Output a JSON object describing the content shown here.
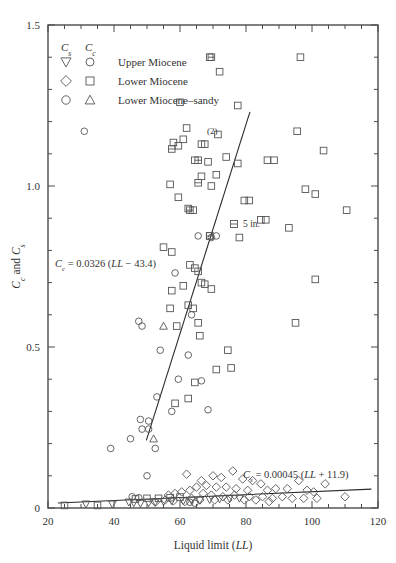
{
  "figure": {
    "title": "",
    "background_color": "#ffffff",
    "marker_color": "#555555",
    "line_color": "#2a2a2a",
    "frame_color": "#4a4a4a"
  },
  "axes": {
    "x": {
      "label_prefix": "Liquid limit (",
      "label_symbol": "LL",
      "label_suffix": ")",
      "label_full": "Liquid limit (LL)",
      "min": 20,
      "max": 120,
      "ticks": [
        20,
        40,
        60,
        80,
        100,
        120
      ],
      "tick_labels": [
        "20",
        "40",
        "60",
        "80",
        "100",
        "120"
      ],
      "minor_tick_step": 5
    },
    "y": {
      "label_full": "Cc and Cs",
      "label_sym1": "C",
      "label_sub1": "c",
      "label_mid": " and ",
      "label_sym2": "C",
      "label_sub2": "s",
      "min": 0,
      "max": 1.5,
      "ticks": [
        0,
        0.5,
        1.0,
        1.5
      ],
      "tick_labels": [
        "0",
        "0.5",
        "1.0",
        "1.5"
      ],
      "minor_tick_step": 0.1
    }
  },
  "legend": {
    "header_cs": "C",
    "header_cs_sub": "s",
    "header_cc": "C",
    "header_cc_sub": "c",
    "rows": [
      {
        "cs_marker": "triangle-down",
        "cc_marker": "circle",
        "label": "Upper Miocene"
      },
      {
        "cs_marker": "diamond",
        "cc_marker": "square",
        "label": "Lower Miocene"
      },
      {
        "cs_marker": "circle",
        "cc_marker": "triangle-up",
        "label": "Lower Miocene–sandy"
      }
    ]
  },
  "annotations": [
    {
      "name": "cc-equation",
      "text": "Cc = 0.0326 (LL − 43.4)",
      "sym": "C",
      "sub": "c",
      "eq": " = 0.0326 (",
      "ital": "LL",
      "tail": " − 43.4)",
      "x": 55,
      "y": 267
    },
    {
      "name": "cs-equation",
      "text": "Cs = 0.00045 (LL + 11.9)",
      "sym": "C",
      "sub": "s",
      "eq": " = 0.00045 (",
      "ital": "LL",
      "tail": " + 11.9)",
      "x": 243,
      "y": 478
    },
    {
      "name": "count-note",
      "text": "(2)",
      "x": 207,
      "y": 134
    },
    {
      "name": "size-note",
      "text": "5 in.",
      "x": 243,
      "y": 227
    }
  ],
  "chart_data": {
    "type": "scatter",
    "title": "",
    "xlabel": "Liquid limit (LL)",
    "ylabel": "Cc and Cs",
    "xlim": [
      20,
      120
    ],
    "ylim": [
      0,
      1.5
    ],
    "grid": false,
    "legend_position": "upper-left-inside",
    "series": [
      {
        "name": "Cc Upper Miocene",
        "marker": "circle",
        "symbol": "Cc",
        "points": [
          [
            31.0,
            1.17
          ],
          [
            58.5,
            0.73
          ],
          [
            63.5,
            0.6
          ],
          [
            47.5,
            0.58
          ],
          [
            48.5,
            0.565
          ],
          [
            54.0,
            0.49
          ],
          [
            62.5,
            0.475
          ],
          [
            59.5,
            0.4
          ],
          [
            66.5,
            0.395
          ],
          [
            53.0,
            0.345
          ],
          [
            68.5,
            0.305
          ],
          [
            57.5,
            0.3
          ],
          [
            48.0,
            0.275
          ],
          [
            50.5,
            0.27
          ],
          [
            48.5,
            0.245
          ],
          [
            50.5,
            0.245
          ],
          [
            45.0,
            0.215
          ],
          [
            39.0,
            0.185
          ],
          [
            52.5,
            0.185
          ],
          [
            50.0,
            0.1
          ],
          [
            69.5,
            0.84
          ],
          [
            71.0,
            0.845
          ],
          [
            65.5,
            0.845
          ]
        ]
      },
      {
        "name": "Cc Lower Miocene",
        "marker": "square",
        "symbol": "Cc",
        "points": [
          [
            69.0,
            1.4
          ],
          [
            96.5,
            1.4
          ],
          [
            72.0,
            1.355
          ],
          [
            60.0,
            1.26
          ],
          [
            77.5,
            1.25
          ],
          [
            62.0,
            1.18
          ],
          [
            95.5,
            1.17
          ],
          [
            71.5,
            1.16
          ],
          [
            103.5,
            1.11
          ],
          [
            58.0,
            1.135
          ],
          [
            59.5,
            1.125
          ],
          [
            61.0,
            1.145
          ],
          [
            66.5,
            1.13
          ],
          [
            67.5,
            1.13
          ],
          [
            64.5,
            1.08
          ],
          [
            68.5,
            1.075
          ],
          [
            74.0,
            1.09
          ],
          [
            86.5,
            1.08
          ],
          [
            88.5,
            1.08
          ],
          [
            66.5,
            1.03
          ],
          [
            69.5,
            1.0
          ],
          [
            98.0,
            0.99
          ],
          [
            101.0,
            0.975
          ],
          [
            57.0,
            1.005
          ],
          [
            59.5,
            0.965
          ],
          [
            62.5,
            0.93
          ],
          [
            64.0,
            0.925
          ],
          [
            110.5,
            0.925
          ],
          [
            93.0,
            0.87
          ],
          [
            69.0,
            0.845
          ],
          [
            78.0,
            0.84
          ],
          [
            55.0,
            0.81
          ],
          [
            57.5,
            0.795
          ],
          [
            101.0,
            0.71
          ],
          [
            63.0,
            0.755
          ],
          [
            64.5,
            0.745
          ],
          [
            65.5,
            0.735
          ],
          [
            66.5,
            0.7
          ],
          [
            67.5,
            0.695
          ],
          [
            69.5,
            0.68
          ],
          [
            61.0,
            0.69
          ],
          [
            57.5,
            0.675
          ],
          [
            62.5,
            0.63
          ],
          [
            64.0,
            0.62
          ],
          [
            57.0,
            0.62
          ],
          [
            65.5,
            0.575
          ],
          [
            95.0,
            0.575
          ],
          [
            59.0,
            0.565
          ],
          [
            66.0,
            0.535
          ],
          [
            74.5,
            0.49
          ],
          [
            75.5,
            0.435
          ],
          [
            71.0,
            0.43
          ],
          [
            64.5,
            0.39
          ],
          [
            62.5,
            0.34
          ],
          [
            58.5,
            0.325
          ],
          [
            84.5,
            0.895
          ],
          [
            86.0,
            0.895
          ],
          [
            79.5,
            0.955
          ],
          [
            81.0,
            0.955
          ],
          [
            77.5,
            1.07
          ],
          [
            71.0,
            1.035
          ]
        ]
      },
      {
        "name": "Cc Lower Miocene-sandy",
        "marker": "triangle-up",
        "symbol": "Cc",
        "points": [
          [
            55.0,
            0.565
          ],
          [
            52.0,
            0.215
          ]
        ]
      },
      {
        "name": "Cc five-inch sample",
        "marker": "square-hbar",
        "symbol": "Cc",
        "points": [
          [
            69.5,
            1.4
          ],
          [
            57.5,
            1.115
          ],
          [
            65.5,
            1.08
          ],
          [
            65.5,
            1.01
          ],
          [
            63.0,
            0.925
          ],
          [
            69.0,
            0.845
          ]
        ]
      },
      {
        "name": "Cs Upper Miocene",
        "marker": "triangle-down",
        "symbol": "Cs",
        "points": [
          [
            31.5,
            0.012
          ],
          [
            39.5,
            0.012
          ],
          [
            44.5,
            0.018
          ],
          [
            46.0,
            0.016
          ],
          [
            48.0,
            0.014
          ],
          [
            50.5,
            0.016
          ],
          [
            52.5,
            0.018
          ],
          [
            55.0,
            0.02
          ],
          [
            57.5,
            0.022
          ],
          [
            61.0,
            0.022
          ],
          [
            63.5,
            0.024
          ],
          [
            66.0,
            0.024
          ],
          [
            69.0,
            0.026
          ],
          [
            72.0,
            0.028
          ],
          [
            75.0,
            0.03
          ],
          [
            78.0,
            0.03
          ]
        ]
      },
      {
        "name": "Cs Lower Miocene",
        "marker": "diamond",
        "symbol": "Cs",
        "points": [
          [
            62.0,
            0.105
          ],
          [
            66.5,
            0.085
          ],
          [
            70.0,
            0.1
          ],
          [
            72.5,
            0.095
          ],
          [
            76.0,
            0.115
          ],
          [
            79.0,
            0.09
          ],
          [
            82.0,
            0.085
          ],
          [
            84.5,
            0.075
          ],
          [
            96.0,
            0.085
          ],
          [
            104.0,
            0.075
          ],
          [
            110.0,
            0.035
          ],
          [
            100.5,
            0.05
          ],
          [
            98.5,
            0.055
          ],
          [
            92.5,
            0.06
          ],
          [
            89.0,
            0.06
          ],
          [
            86.5,
            0.055
          ],
          [
            80.5,
            0.055
          ],
          [
            77.0,
            0.06
          ],
          [
            74.0,
            0.065
          ],
          [
            71.0,
            0.065
          ],
          [
            68.0,
            0.07
          ],
          [
            65.0,
            0.065
          ],
          [
            63.0,
            0.055
          ],
          [
            60.5,
            0.05
          ],
          [
            58.5,
            0.045
          ],
          [
            56.5,
            0.04
          ],
          [
            67.0,
            0.045
          ],
          [
            69.5,
            0.04
          ],
          [
            73.0,
            0.035
          ],
          [
            76.5,
            0.04
          ],
          [
            81.0,
            0.035
          ],
          [
            85.0,
            0.035
          ],
          [
            88.0,
            0.03
          ],
          [
            91.0,
            0.035
          ],
          [
            94.0,
            0.03
          ],
          [
            97.5,
            0.03
          ],
          [
            101.5,
            0.03
          ],
          [
            63.5,
            0.03
          ],
          [
            66.0,
            0.025
          ],
          [
            70.5,
            0.025
          ],
          [
            74.5,
            0.025
          ],
          [
            79.5,
            0.025
          ],
          [
            83.0,
            0.025
          ],
          [
            87.0,
            0.02
          ],
          [
            61.5,
            0.02
          ],
          [
            58.0,
            0.022
          ],
          [
            55.5,
            0.025
          ],
          [
            52.5,
            0.018
          ]
        ]
      },
      {
        "name": "Cs Lower Miocene-sandy",
        "marker": "circle",
        "symbol": "Cs",
        "points": [
          [
            45.5,
            0.035
          ],
          [
            47.5,
            0.032
          ],
          [
            63.0,
            0.018
          ],
          [
            64.5,
            0.015
          ]
        ]
      },
      {
        "name": "Cs squares low",
        "marker": "square",
        "symbol": "Cs",
        "points": [
          [
            25.0,
            0.008
          ],
          [
            35.0,
            0.008
          ],
          [
            46.5,
            0.028
          ],
          [
            50.0,
            0.03
          ],
          [
            53.5,
            0.03
          ],
          [
            57.0,
            0.032
          ],
          [
            60.0,
            0.034
          ]
        ]
      }
    ],
    "fit_lines": [
      {
        "name": "Cc regression",
        "equation": "Cc = 0.0326 (LL - 43.4)",
        "slope": 0.0326,
        "intercept_x": 43.4,
        "x_start": 49.8,
        "x_end": 81.2,
        "y_start": 0.21,
        "y_end": 1.23
      },
      {
        "name": "Cs regression",
        "equation": "Cs = 0.00045 (LL + 11.9)",
        "slope": 0.00045,
        "offset_x": 11.9,
        "x_start": 23.0,
        "x_end": 118.0,
        "y_start": 0.0157,
        "y_end": 0.0585
      }
    ]
  }
}
